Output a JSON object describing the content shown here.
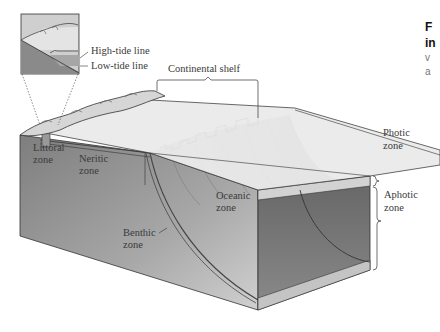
{
  "figure": {
    "inset_labels": {
      "high_tide": "High-tide line",
      "low_tide": "Low-tide line"
    },
    "labels": {
      "continental_shelf": "Continental shelf",
      "littoral_1": "Littoral",
      "littoral_2": "zone",
      "neritic_1": "Neritic",
      "neritic_2": "zone",
      "oceanic_1": "Oceanic",
      "oceanic_2": "zone",
      "benthic_1": "Benthic",
      "benthic_2": "zone",
      "photic_1": "Photic",
      "photic_2": "zone",
      "aphotic_1": "Aphotic",
      "aphotic_2": "zone"
    },
    "caption_fragment": {
      "line1": "F",
      "line2": "in",
      "line3": "v",
      "line4": "a"
    },
    "colors": {
      "sea_surface": "#e9e9e9",
      "photic_band": "#cfcfcf",
      "deep_water": "#5a5a5a",
      "aphotic_mid": "#7a7a7a",
      "seafloor_sediment": "#c4c4c4",
      "land_face": "#8c8c8c",
      "outline": "#333333"
    }
  }
}
